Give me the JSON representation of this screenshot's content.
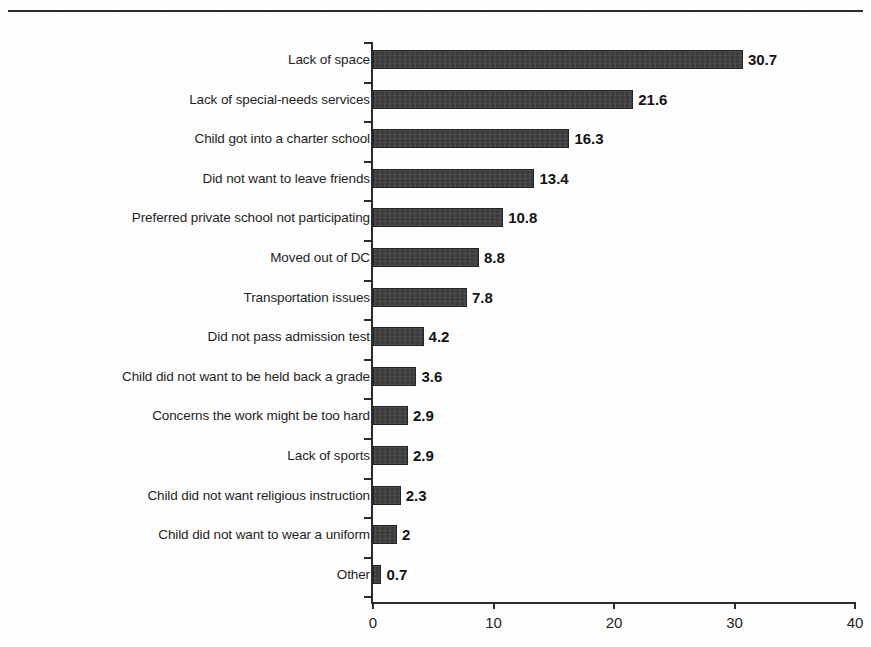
{
  "chart_data": {
    "type": "bar",
    "orientation": "horizontal",
    "title": "",
    "xlabel": "",
    "ylabel": "",
    "xlim": [
      0,
      40
    ],
    "xticks": [
      "0",
      "10",
      "20",
      "30",
      "40"
    ],
    "grid": false,
    "legend": false,
    "bar_color": "#3b3b3b",
    "categories": [
      "Lack of space",
      "Lack of special-needs services",
      "Child got into a charter school",
      "Did not want to leave friends",
      "Preferred private school not participating",
      "Moved out of DC",
      "Transportation issues",
      "Did not pass admission test",
      "Child did not want to be held back a grade",
      "Concerns the work might be too hard",
      "Lack of sports",
      "Child did not want religious instruction",
      "Child did not want to wear a uniform",
      "Other"
    ],
    "values": [
      30.7,
      21.6,
      16.3,
      13.4,
      10.8,
      8.8,
      7.8,
      4.2,
      3.6,
      2.9,
      2.9,
      2.3,
      2,
      0.7
    ],
    "value_labels": [
      "30.7",
      "21.6",
      "16.3",
      "13.4",
      "10.8",
      "8.8",
      "7.8",
      "4.2",
      "3.6",
      "2.9",
      "2.9",
      "2.3",
      "2",
      "0.7"
    ]
  }
}
